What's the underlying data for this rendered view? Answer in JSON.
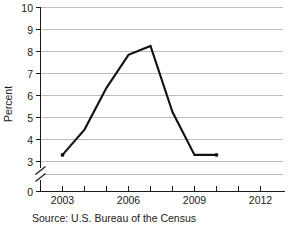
{
  "chart_data": {
    "type": "line",
    "title": "",
    "xlabel": "",
    "ylabel": "Percent",
    "x": [
      2003,
      2004,
      2005,
      2006,
      2007,
      2008,
      2009,
      2010
    ],
    "values": [
      3.3,
      4.45,
      6.35,
      7.85,
      8.25,
      5.25,
      3.3,
      3.3
    ],
    "series": [
      {
        "name": "Percent",
        "values": [
          3.3,
          4.45,
          6.35,
          7.85,
          8.25,
          5.25,
          3.3,
          3.3
        ]
      }
    ],
    "xlim": [
      2002,
      2012.6
    ],
    "ylim": [
      3,
      10
    ],
    "y_axis_break": true,
    "y_break_between": [
      0,
      3
    ],
    "y_tick_labels": [
      "0",
      "3",
      "4",
      "5",
      "6",
      "7",
      "8",
      "9",
      "10"
    ],
    "y_tick_values": [
      0,
      3,
      4,
      5,
      6,
      7,
      8,
      9,
      10
    ],
    "x_tick_labels": [
      "2003",
      "2006",
      "2009",
      "2012"
    ],
    "x_tick_values": [
      2003,
      2006,
      2009,
      2012
    ],
    "x_minor_ticks": [
      2003,
      2004,
      2005,
      2006,
      2007,
      2008,
      2009,
      2010,
      2011,
      2012
    ],
    "grid": "horizontal",
    "legend": "none",
    "line_color": "#111111",
    "grid_color": "#bdbdbd",
    "axis_color": "#1a1a1a"
  },
  "source": {
    "note": "Source: U.S. Bureau of the Census"
  },
  "axes": {
    "y_title": "Percent"
  }
}
